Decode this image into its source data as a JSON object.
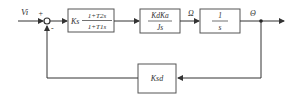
{
  "diagram": {
    "type": "block-diagram",
    "input_label": "Vi",
    "summing_junction": {
      "plus": "+",
      "minus": "-"
    },
    "blocks": [
      {
        "id": "controller",
        "gain": "Ks",
        "numerator": "1+T2s",
        "denominator": "1+T1s"
      },
      {
        "id": "motor",
        "numerator": "KdKa",
        "denominator": "Js"
      },
      {
        "id": "integrator",
        "numerator": "1",
        "denominator": "s"
      },
      {
        "id": "feedback",
        "label": "Ksd"
      }
    ],
    "signals": {
      "omega": "Ω",
      "theta": "Θ"
    },
    "colors": {
      "line": "#333333",
      "box_border": "#555555",
      "background": "#ffffff"
    }
  }
}
